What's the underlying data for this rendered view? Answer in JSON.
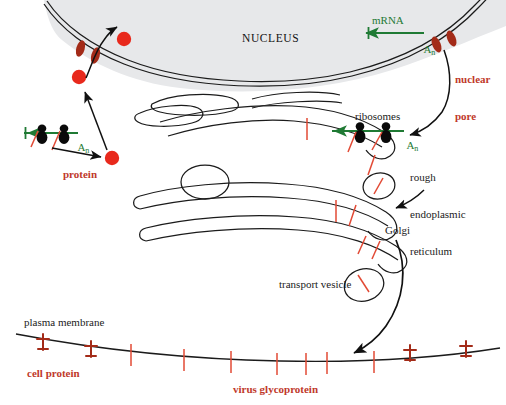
{
  "figure": {
    "background_color": "#ffffff",
    "nucleus_fill": "#e7e8ea",
    "membrane_color": "#1b1b1b",
    "protein_dot_color": "#e8291c",
    "pore_color": "#a32b18",
    "glycoprotein_color": "#e24a35",
    "mrna_color": "#1f7a34",
    "ribosome_color": "#0a0a0a",
    "label_red_color": "#c0392b",
    "label_dark_color": "#1b1b1b"
  },
  "labels": {
    "nucleus": "NUCLEUS",
    "nuclear_pore": "nuclear\npore",
    "nuclear_pore_line1": "nuclear",
    "nuclear_pore_line2": "pore",
    "mrna": "mRNA",
    "poly_a_tail": "A",
    "poly_a_subscript": "n",
    "ribosomes": "ribosomes",
    "rough_er_line1": "rough",
    "rough_er_line2": "endoplasmic",
    "rough_er_line3": "reticulum",
    "golgi": "Golgi",
    "transport_vesicle": "transport vesicle",
    "plasma_membrane": "plasma membrane",
    "cell_protein": "cell protein",
    "virus_glycoprotein": "virus glycoprotein",
    "protein": "protein"
  },
  "diagram_content": {
    "type": "biological-schematic",
    "compartments": [
      "nucleus",
      "nuclear envelope",
      "rough endoplasmic reticulum",
      "Golgi",
      "transport vesicle",
      "plasma membrane"
    ],
    "molecular_species": [
      {
        "name": "mRNA",
        "color": "#1f7a34",
        "count": 2,
        "locations": [
          "nucleus exit near nuclear pore",
          "bound to ribosomes on rough ER"
        ]
      },
      {
        "name": "ribosome",
        "color": "#0a0a0a",
        "count": 4,
        "locations": [
          "free cytosolic polysome (left)",
          "membrane-bound polysome on rough ER (right)"
        ]
      },
      {
        "name": "protein",
        "color": "#e8291c",
        "count": 3,
        "locations": [
          "cytosol near free ribosome",
          "cytosol below nuclear pore",
          "inside nucleus"
        ]
      },
      {
        "name": "virus glycoprotein",
        "color": "#e24a35",
        "count": 12,
        "locations": [
          "rough ER lumen",
          "Golgi",
          "transport vesicle",
          "plasma membrane"
        ]
      },
      {
        "name": "cell protein",
        "color": "#a32b18",
        "count": 4,
        "locations": [
          "plasma membrane left",
          "plasma membrane right"
        ]
      },
      {
        "name": "nuclear pore",
        "color": "#a32b18",
        "count": 2,
        "locations": [
          "left nuclear envelope",
          "right nuclear envelope"
        ]
      }
    ],
    "transport_arrows": [
      "nucleus-to-cytoplasm protein import through left nuclear pore",
      "free ribosome to cytosolic protein",
      "cytosolic protein up to nuclear pore",
      "mRNA export from nucleus through right pore to rough ER ribosomes",
      "rough ER to Golgi",
      "Golgi to plasma membrane via transport vesicle"
    ]
  }
}
